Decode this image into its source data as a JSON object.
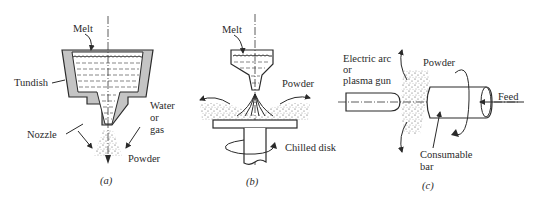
{
  "figure": {
    "panels": [
      {
        "id": "a",
        "caption": "(a)",
        "labels": {
          "melt": "Melt",
          "tundish": "Tundish",
          "nozzle": "Nozzle",
          "water_line1": "Water",
          "water_line2": "or",
          "water_line3": "gas",
          "powder": "Powder"
        }
      },
      {
        "id": "b",
        "caption": "(b)",
        "labels": {
          "melt": "Melt",
          "powder": "Powder",
          "chilled_disk": "Chilled disk"
        }
      },
      {
        "id": "c",
        "caption": "(c)",
        "labels": {
          "gun_line1": "Electric arc",
          "gun_line2": "or",
          "gun_line3": "plasma gun",
          "powder": "Powder",
          "feed": "Feed",
          "bar_line1": "Consumable",
          "bar_line2": "bar"
        }
      }
    ]
  }
}
